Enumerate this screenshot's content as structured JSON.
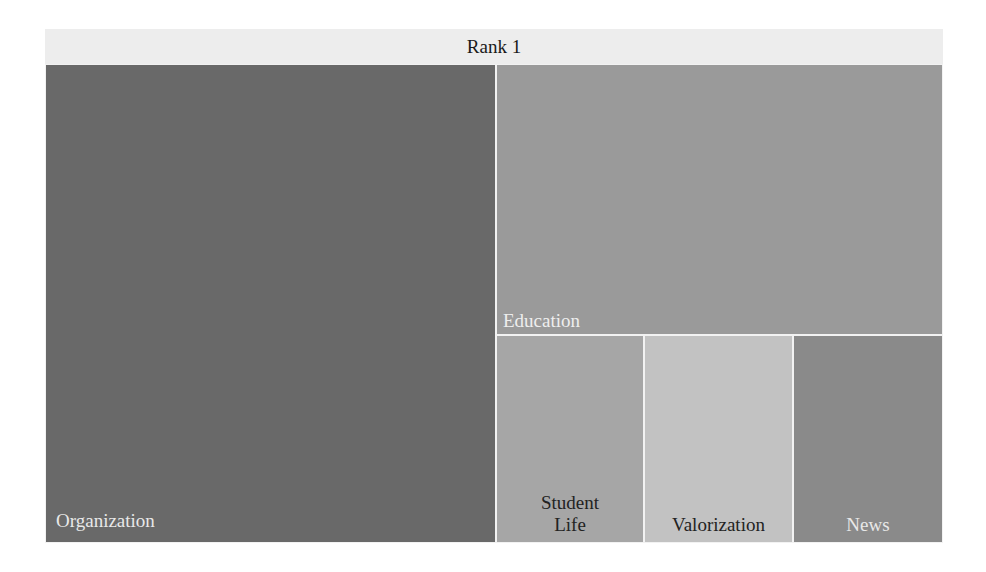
{
  "chart_data": {
    "type": "treemap",
    "title": "Rank 1",
    "root": "Rank 1",
    "nodes": [
      {
        "label": "Organization",
        "relative_area": 0.5,
        "color": "#696969",
        "text_color": "#e8e8e8"
      },
      {
        "label": "Education",
        "relative_area": 0.298,
        "color": "#9a9a9a",
        "text_color": "#eeeeee"
      },
      {
        "label": "Student Life",
        "relative_area": 0.067,
        "color": "#a6a6a6",
        "text_color": "#222222"
      },
      {
        "label": "Valorization",
        "relative_area": 0.067,
        "color": "#c2c2c2",
        "text_color": "#222222"
      },
      {
        "label": "News",
        "relative_area": 0.068,
        "color": "#8a8a8a",
        "text_color": "#e8e8e8"
      }
    ]
  },
  "header": {
    "title": "Rank 1"
  },
  "cells": [
    {
      "label": "Organization",
      "x": 0,
      "y": 35,
      "w": 451,
      "h": 479,
      "color": "#696969",
      "text_color": "#e8e8e8"
    },
    {
      "label": "Education",
      "x": 451,
      "y": 35,
      "w": 447,
      "h": 271,
      "color": "#9a9a9a",
      "text_color": "#eeeeee"
    },
    {
      "label": "Student\nLife",
      "x": 451,
      "y": 306,
      "w": 148,
      "h": 208,
      "color": "#a6a6a6",
      "text_color": "#222222"
    },
    {
      "label": "Valorization",
      "x": 599,
      "y": 306,
      "w": 149,
      "h": 208,
      "color": "#c2c2c2",
      "text_color": "#222222"
    },
    {
      "label": "News",
      "x": 748,
      "y": 306,
      "w": 150,
      "h": 208,
      "color": "#8a8a8a",
      "text_color": "#e8e8e8"
    }
  ]
}
